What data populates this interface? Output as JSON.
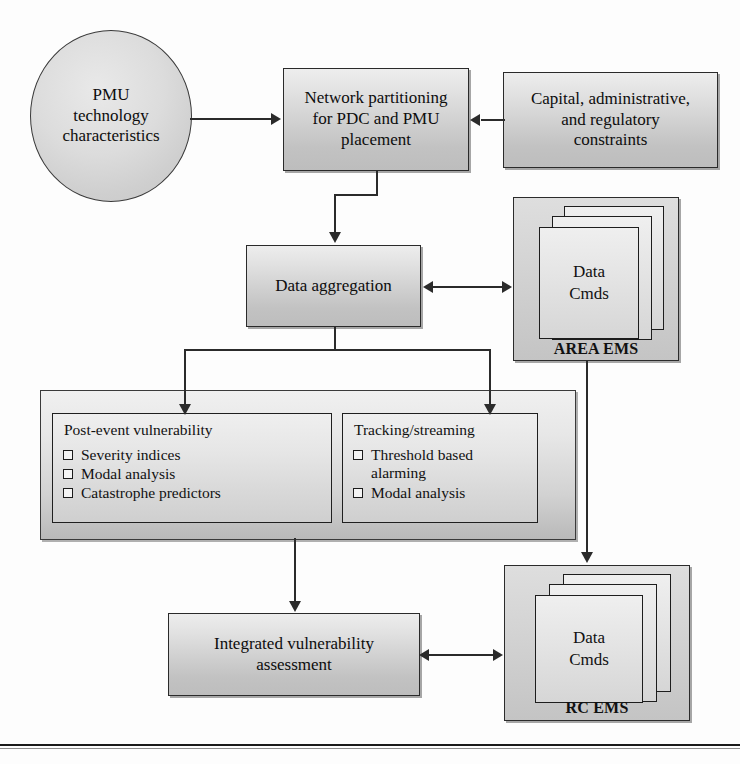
{
  "diagram": {
    "type": "flowchart",
    "colors": {
      "box_fill_light": "#ededed",
      "box_fill_dark": "#bdbdbd",
      "border": "#2a2a2a",
      "container_fill": "#d2d2d2",
      "page_background": "#fdfdfd"
    },
    "nodes": {
      "pmu_ellipse": {
        "label": "PMU\ntechnology\ncharacteristics",
        "lines": [
          "PMU",
          "technology",
          "characteristics"
        ],
        "shape": "ellipse"
      },
      "network_partitioning": {
        "label": "Network partitioning for PDC and PMU placement",
        "lines": [
          "Network partitioning",
          "for PDC and PMU",
          "placement"
        ],
        "shape": "rect"
      },
      "constraints": {
        "label": "Capital, administrative, and regulatory constraints",
        "lines": [
          "Capital, administrative,",
          "and regulatory",
          "constraints"
        ],
        "shape": "rect"
      },
      "data_aggregation": {
        "label": "Data aggregation",
        "lines": [
          "Data aggregation"
        ],
        "shape": "rect"
      },
      "integrated_assessment": {
        "label": "Integrated vulnerability assessment",
        "lines": [
          "Integrated vulnerability",
          "assessment"
        ],
        "shape": "rect"
      },
      "area_ems": {
        "label": "AREA EMS",
        "card_lines": [
          "Data",
          "Cmds"
        ],
        "shape": "stacked-cards"
      },
      "rc_ems": {
        "label": "RC EMS",
        "card_lines": [
          "Data",
          "Cmds"
        ],
        "shape": "stacked-cards"
      }
    },
    "analysis_container": {
      "panels": [
        {
          "header": "Post-event vulnerability",
          "items": [
            "Severity indices",
            "Modal analysis",
            "Catastrophe predictors"
          ]
        },
        {
          "header": "Tracking/streaming",
          "items": [
            "Threshold based alarming",
            "Modal analysis"
          ]
        }
      ]
    },
    "edges": [
      {
        "from": "pmu_ellipse",
        "to": "network_partitioning",
        "style": "arrow-right"
      },
      {
        "from": "constraints",
        "to": "network_partitioning",
        "style": "arrow-left"
      },
      {
        "from": "network_partitioning",
        "to": "data_aggregation",
        "style": "arrow-down"
      },
      {
        "from": "data_aggregation",
        "to": "area_ems",
        "style": "double-arrow"
      },
      {
        "from": "data_aggregation",
        "to": "post_event_vulnerability",
        "style": "arrow-down"
      },
      {
        "from": "data_aggregation",
        "to": "tracking_streaming",
        "style": "arrow-down"
      },
      {
        "from": "area_ems",
        "to": "rc_ems",
        "style": "arrow-down"
      },
      {
        "from": "analysis_container",
        "to": "integrated_assessment",
        "style": "arrow-down"
      },
      {
        "from": "integrated_assessment",
        "to": "rc_ems",
        "style": "double-arrow"
      }
    ]
  }
}
